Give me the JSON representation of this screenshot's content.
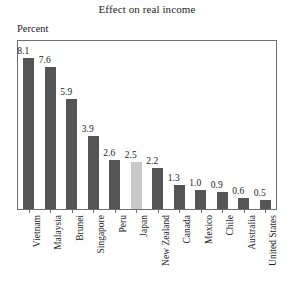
{
  "chart_data": {
    "type": "bar",
    "title": "Effect on real income",
    "xlabel": "",
    "ylabel": "Percent",
    "ylim": [
      0,
      9
    ],
    "grid": false,
    "legend": "none",
    "categories": [
      "Vietnam",
      "Malaysia",
      "Brunei",
      "Singapore",
      "Peru",
      "Japan",
      "New Zealand",
      "Canada",
      "Mexico",
      "Chile",
      "Australia",
      "United States"
    ],
    "values": [
      8.1,
      7.6,
      5.9,
      3.9,
      2.6,
      2.5,
      2.2,
      1.3,
      1.0,
      0.9,
      0.6,
      0.5
    ],
    "value_labels": [
      "8.1",
      "7.6",
      "5.9",
      "3.9",
      "2.6",
      "2.5",
      "2.2",
      "1.3",
      "1.0",
      "0.9",
      "0.6",
      "0.5"
    ],
    "highlight_category": "Japan",
    "colors": {
      "bar": "#555555",
      "bar_highlight": "#c9c9c9",
      "frame": "#6e6e6e",
      "text": "#1c1c1c",
      "background": "#ffffff"
    }
  }
}
